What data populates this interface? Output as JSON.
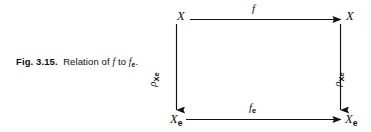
{
  "figure": {
    "number": "Fig. 3.15.",
    "caption_prefix": "Relation of ",
    "caption_map_1": "f",
    "caption_middle": " to ",
    "caption_map_2": "f",
    "caption_map_2_sub": "e",
    "caption_suffix": "."
  },
  "diagram": {
    "type": "commutative-square",
    "stroke_color": "#111111",
    "background": "#ffffff",
    "nodes": [
      {
        "id": "top-left",
        "label": "X",
        "sub": ""
      },
      {
        "id": "top-right",
        "label": "X",
        "sub": ""
      },
      {
        "id": "bottom-left",
        "label": "X",
        "sub": "e"
      },
      {
        "id": "bottom-right",
        "label": "X",
        "sub": "e"
      }
    ],
    "arrows": [
      {
        "id": "top",
        "label": "f",
        "sub": "",
        "from": "top-left",
        "to": "top-right",
        "direction": "right"
      },
      {
        "id": "bottom",
        "label": "f",
        "sub": "e",
        "from": "bottom-left",
        "to": "bottom-right",
        "direction": "right"
      },
      {
        "id": "left",
        "label": "ρ",
        "sub": "Xe",
        "from": "top-left",
        "to": "bottom-left",
        "direction": "down"
      },
      {
        "id": "right",
        "label": "ρ",
        "sub": "Xe",
        "from": "top-right",
        "to": "bottom-right",
        "direction": "down"
      }
    ]
  }
}
